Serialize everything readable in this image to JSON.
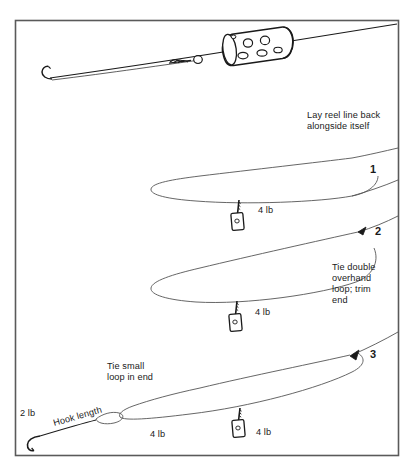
{
  "figure": {
    "background_color": "#ffffff",
    "line_color": "#1a1a1a",
    "frame_color": "#555555",
    "frame": {
      "x": 15,
      "y": 20,
      "width": 383,
      "height": 435
    }
  },
  "annotations": {
    "lay_line_back": "Lay reel line back\nalongside itself",
    "tie_double_overhand": "Tie double\noverhand\nloop; trim\nend",
    "tie_small_loop": "Tie small\nloop in end",
    "hook_length": "Hook length"
  },
  "steps": [
    {
      "number": "1",
      "x": 370,
      "y": 163
    },
    {
      "number": "2",
      "x": 375,
      "y": 225
    },
    {
      "number": "3",
      "x": 370,
      "y": 348
    }
  ],
  "weight_labels": [
    {
      "text": "4 lb",
      "x": 258,
      "y": 205
    },
    {
      "text": "4 lb",
      "x": 255,
      "y": 307
    },
    {
      "text": "2 lb",
      "x": 20,
      "y": 408
    },
    {
      "text": "4 lb",
      "x": 150,
      "y": 429
    },
    {
      "text": "4 lb",
      "x": 256,
      "y": 427
    }
  ],
  "components": {
    "hook_top": "hook-icon",
    "swimfeeder": "swimfeeder-icon",
    "bead": "bead-icon",
    "swivel_knot": "knot-icon",
    "hook_bottom": "hook-icon",
    "feeder_weight_1": "feeder-weight-icon",
    "feeder_weight_2": "feeder-weight-icon",
    "feeder_weight_3": "feeder-weight-icon"
  }
}
